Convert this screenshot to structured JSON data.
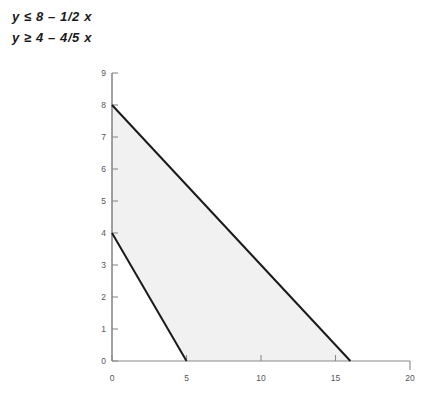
{
  "inequalities": {
    "line1": "y ≤ 8 – 1/2 x",
    "line2": "y ≥ 4 – 4/5 x"
  },
  "chart_data": {
    "type": "line",
    "title": "",
    "xlabel": "",
    "ylabel": "",
    "xlim": [
      0,
      20
    ],
    "ylim": [
      0,
      9
    ],
    "grid": false,
    "legend": false,
    "xticks": [
      "0",
      "5",
      "10",
      "15",
      "20"
    ],
    "xtick_values": [
      0,
      5,
      10,
      15,
      20
    ],
    "yticks": [
      "0",
      "1",
      "2",
      "3",
      "4",
      "5",
      "6",
      "7",
      "8",
      "9"
    ],
    "ytick_values": [
      0,
      1,
      2,
      3,
      4,
      5,
      6,
      7,
      8,
      9
    ],
    "series": [
      {
        "name": "y = 8 - 1/2 x",
        "x": [
          0,
          16
        ],
        "y": [
          8,
          0
        ],
        "intercept": 8,
        "slope": -0.5,
        "color": "#1a1a1a"
      },
      {
        "name": "y = 4 - 4/5 x",
        "x": [
          0,
          5
        ],
        "y": [
          4,
          0
        ],
        "intercept": 4,
        "slope": -0.8,
        "color": "#1a1a1a"
      }
    ],
    "shaded_region": {
      "name": "feasible-region",
      "fill": "#f1f1f1",
      "vertices": [
        [
          0,
          8
        ],
        [
          16,
          0
        ],
        [
          5,
          0
        ],
        [
          0,
          4
        ]
      ]
    },
    "axis_color": "#808080",
    "annotations": [
      "y ≤ 8 – 1/2 x",
      "y ≥ 4 – 4/5 x"
    ]
  }
}
